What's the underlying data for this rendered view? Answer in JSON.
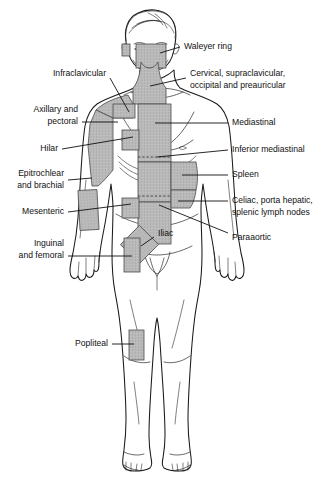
{
  "figure": {
    "body_color": "#ffffff",
    "outline_color": "#1a1a1a",
    "node_shade_color": "#b9b9b9",
    "leader_color": "#111111"
  },
  "labels": {
    "waldeyer": "Waleyer ring",
    "cervical_line1": "Cervical, supraclavicular,",
    "cervical_line2": "occipital and preauricular",
    "infraclavicular": "Infraclavicular",
    "axillary_line1": "Axillary and",
    "axillary_line2": "pectoral",
    "hilar": "Hilar",
    "mediastinal": "Mediastinal",
    "inferior_mediastinal": "Inferior mediastinal",
    "spleen": "Spleen",
    "epitrochlear_line1": "Epitrochlear",
    "epitrochlear_line2": "and brachial",
    "mesenteric": "Mesenteric",
    "celiac_line1": "Celiac, porta hepatic,",
    "celiac_line2": "splenic lymph nodes",
    "paraaortic": "Paraaortic",
    "inguinal_line1": "Inguinal",
    "inguinal_line2": "and femoral",
    "iliac": "Iliac",
    "popliteal": "Popliteal"
  }
}
